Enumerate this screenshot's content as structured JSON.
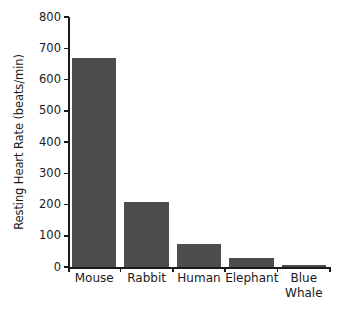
{
  "chart_data": {
    "type": "bar",
    "title": "",
    "xlabel": "",
    "ylabel": "Resting Heart Rate (beats/min)",
    "categories": [
      "Mouse",
      "Rabbit",
      "Human",
      "Elephant",
      "Blue Whale"
    ],
    "category_lines": [
      [
        "Mouse"
      ],
      [
        "Rabbit"
      ],
      [
        "Human"
      ],
      [
        "Elephant"
      ],
      [
        "Blue",
        "Whale"
      ]
    ],
    "values": [
      670,
      208,
      74,
      29,
      6
    ],
    "ylim": [
      0,
      800
    ],
    "yticks": [
      0,
      100,
      200,
      300,
      400,
      500,
      600,
      700,
      800
    ],
    "ytick_labels": [
      "0",
      "100",
      "200",
      "300",
      "400",
      "500",
      "600",
      "700",
      "800"
    ],
    "grid": false,
    "legend": null,
    "bar_color": "#4d4d4d",
    "axis_color": "#1a1a1a",
    "background_color": "#ffffff"
  }
}
